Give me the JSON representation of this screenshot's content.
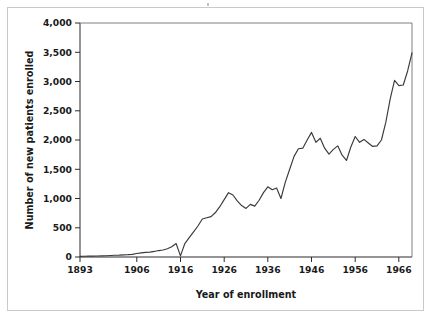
{
  "figure": {
    "background_color": "#ffffff",
    "frame_color": "#c9c9c9",
    "line_color": "#3a3a3a",
    "axis_color": "#2b2b2b",
    "text_color": "#1a1a1a"
  },
  "chart_data": {
    "type": "line",
    "title": "",
    "subtitle": "",
    "xlabel": "Year of enrollment",
    "ylabel": "Number of new patients enrolled",
    "xlim": [
      1893,
      1969
    ],
    "ylim": [
      0,
      4000
    ],
    "grid": false,
    "legend": null,
    "xticks": [
      1893,
      1906,
      1916,
      1926,
      1936,
      1946,
      1956,
      1966
    ],
    "xtick_labels": [
      "1893",
      "1906",
      "1916",
      "1926",
      "1936",
      "1946",
      "1956",
      "1966"
    ],
    "yticks": [
      0,
      500,
      1000,
      1500,
      2000,
      2500,
      3000,
      3500,
      4000
    ],
    "ytick_labels": [
      "0",
      "500",
      "1,000",
      "1,500",
      "2,000",
      "2,500",
      "3,000",
      "3,500",
      "4,000"
    ],
    "series": [
      {
        "name": "New patients enrolled",
        "x": [
          1893,
          1894,
          1895,
          1896,
          1897,
          1898,
          1899,
          1900,
          1901,
          1902,
          1903,
          1904,
          1905,
          1906,
          1907,
          1908,
          1909,
          1910,
          1911,
          1912,
          1913,
          1914,
          1915,
          1916,
          1917,
          1918,
          1919,
          1920,
          1921,
          1922,
          1923,
          1924,
          1925,
          1926,
          1927,
          1928,
          1929,
          1930,
          1931,
          1932,
          1933,
          1934,
          1935,
          1936,
          1937,
          1938,
          1939,
          1940,
          1941,
          1942,
          1943,
          1944,
          1945,
          1946,
          1947,
          1948,
          1949,
          1950,
          1951,
          1952,
          1953,
          1954,
          1955,
          1956,
          1957,
          1958,
          1959,
          1960,
          1961,
          1962,
          1963,
          1964,
          1965,
          1966,
          1967,
          1968,
          1969
        ],
        "values": [
          10,
          12,
          14,
          16,
          18,
          20,
          22,
          26,
          30,
          32,
          36,
          40,
          46,
          60,
          70,
          78,
          84,
          95,
          110,
          120,
          140,
          175,
          230,
          20,
          230,
          330,
          430,
          530,
          650,
          670,
          690,
          760,
          860,
          980,
          1100,
          1060,
          960,
          880,
          830,
          900,
          870,
          970,
          1100,
          1200,
          1150,
          1180,
          1000,
          1280,
          1500,
          1720,
          1850,
          1860,
          2000,
          2130,
          1960,
          2030,
          1860,
          1760,
          1840,
          1900,
          1740,
          1650,
          1880,
          2060,
          1960,
          2010,
          1950,
          1890,
          1900,
          2000,
          2300,
          2700,
          3020,
          2930,
          2940,
          3180,
          3490
        ]
      }
    ]
  },
  "axis": {
    "x_title": "Year of enrollment",
    "y_title": "Number of new patients enrolled"
  }
}
